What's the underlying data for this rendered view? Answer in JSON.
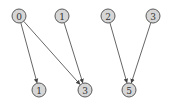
{
  "diagram": {
    "type": "directed-graph",
    "node_style": {
      "fill": "#d6d6d6",
      "stroke": "#5a5a5a",
      "radius": 7
    },
    "edge_color": "#555555",
    "nodes": [
      {
        "id": "t0",
        "label": "0",
        "x": 19,
        "y": 16
      },
      {
        "id": "t1",
        "label": "1",
        "x": 62,
        "y": 16
      },
      {
        "id": "t2",
        "label": "2",
        "x": 108,
        "y": 16
      },
      {
        "id": "t3",
        "label": "3",
        "x": 153,
        "y": 16
      },
      {
        "id": "b1",
        "label": "1",
        "x": 39,
        "y": 90
      },
      {
        "id": "b3",
        "label": "3",
        "x": 85,
        "y": 90
      },
      {
        "id": "b5",
        "label": "5",
        "x": 129,
        "y": 90
      }
    ],
    "edges": [
      {
        "from": "t0",
        "to": "b1"
      },
      {
        "from": "t0",
        "to": "b3"
      },
      {
        "from": "t1",
        "to": "b3"
      },
      {
        "from": "t2",
        "to": "b5"
      },
      {
        "from": "t3",
        "to": "b5"
      }
    ]
  }
}
